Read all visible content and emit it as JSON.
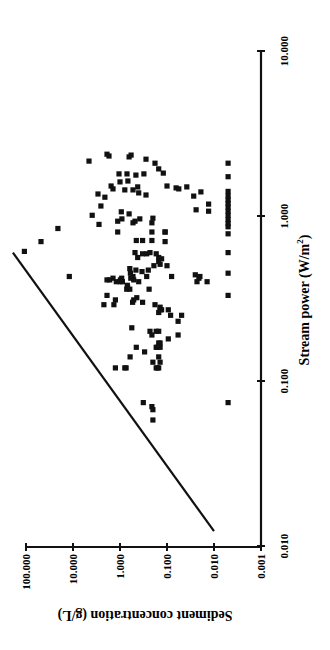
{
  "chart_data": {
    "type": "scatter",
    "orientation": "figure rotated 90 degrees counter-clockwise",
    "title": "",
    "xlabel": "Stream power (W/m²)",
    "xlabel_base": "Stream power (W/m",
    "xlabel_sup": "2",
    "xlabel_tail": ")",
    "ylabel": "Sediment concentration (g/L)",
    "xscale": "log",
    "yscale": "log",
    "xlim": [
      0.01,
      10
    ],
    "ylim": [
      0.001,
      100
    ],
    "x_ticks": [
      "0.010",
      "0.100",
      "1.000",
      "10.000"
    ],
    "y_ticks": [
      "0.001",
      "0.010",
      "0.100",
      "1.000",
      "10.000",
      "100.000"
    ],
    "grid": false,
    "legend": null,
    "marker": "filled square",
    "marker_color": "#111111",
    "line": {
      "name": "threshold line",
      "points": [
        [
          0.0123,
          0.01
        ],
        [
          0.6,
          190
        ]
      ]
    },
    "series": [
      {
        "name": "observations",
        "points": [
          [
            2.15,
            4.57
          ],
          [
            2.37,
            1.89
          ],
          [
            2.31,
            1.71
          ],
          [
            2.28,
            0.64
          ],
          [
            2.34,
            0.58
          ],
          [
            2.21,
            0.28
          ],
          [
            2.09,
            0.18
          ],
          [
            1.93,
            0.15
          ],
          [
            1.82,
            0.12
          ],
          [
            1.8,
            1.05
          ],
          [
            1.8,
            0.71
          ],
          [
            1.77,
            0.46
          ],
          [
            1.8,
            0.31
          ],
          [
            1.61,
            1.0
          ],
          [
            1.63,
            0.68
          ],
          [
            1.52,
            1.55
          ],
          [
            1.46,
            1.41
          ],
          [
            1.44,
            0.79
          ],
          [
            1.44,
            0.53
          ],
          [
            1.5,
            0.42
          ],
          [
            1.38,
            0.4
          ],
          [
            1.34,
            0.28
          ],
          [
            1.52,
            0.1
          ],
          [
            1.48,
            0.064
          ],
          [
            1.46,
            0.056
          ],
          [
            1.5,
            0.038
          ],
          [
            1.32,
            0.027
          ],
          [
            1.4,
            0.019
          ],
          [
            1.36,
            2.94
          ],
          [
            1.3,
            2.1
          ],
          [
            1.15,
            2.55
          ],
          [
            1.09,
            0.024
          ],
          [
            1.18,
            0.013
          ],
          [
            1.07,
            0.013
          ],
          [
            1.01,
            3.9
          ],
          [
            0.89,
            2.8
          ],
          [
            1.06,
            0.94
          ],
          [
            0.96,
            0.91
          ],
          [
            1.03,
            0.64
          ],
          [
            0.91,
            0.53
          ],
          [
            0.96,
            0.38
          ],
          [
            0.97,
            0.2
          ],
          [
            0.91,
            0.21
          ],
          [
            0.84,
            21
          ],
          [
            0.7,
            48
          ],
          [
            0.61,
            108
          ],
          [
            0.93,
            1.12
          ],
          [
            0.8,
            1.12
          ],
          [
            0.93,
            0.48
          ],
          [
            0.71,
            0.45
          ],
          [
            0.71,
            0.33
          ],
          [
            0.8,
            0.21
          ],
          [
            0.71,
            0.21
          ],
          [
            0.8,
            0.11
          ],
          [
            0.8,
            0.11
          ],
          [
            0.7,
            0.11
          ],
          [
            0.6,
            0.48
          ],
          [
            0.56,
            0.42
          ],
          [
            0.59,
            0.33
          ],
          [
            0.59,
            0.27
          ],
          [
            0.6,
            0.23
          ],
          [
            0.56,
            0.15
          ],
          [
            0.53,
            0.15
          ],
          [
            0.55,
            0.13
          ],
          [
            0.59,
            0.17
          ],
          [
            0.5,
            0.19
          ],
          [
            0.47,
            0.25
          ],
          [
            0.43,
            0.27
          ],
          [
            0.46,
            0.34
          ],
          [
            0.48,
            0.62
          ],
          [
            0.47,
            0.46
          ],
          [
            0.45,
            0.6
          ],
          [
            0.43,
            0.53
          ],
          [
            0.42,
            0.92
          ],
          [
            0.4,
            0.99
          ],
          [
            0.36,
            0.72
          ],
          [
            0.41,
            0.51
          ],
          [
            0.37,
            0.69
          ],
          [
            0.38,
            0.7
          ],
          [
            0.41,
            0.98
          ],
          [
            0.36,
            0.62
          ],
          [
            0.43,
            12
          ],
          [
            0.43,
            0.08
          ],
          [
            0.5,
            0.1
          ],
          [
            0.51,
            0.14
          ],
          [
            0.43,
            0.02
          ],
          [
            0.44,
            0.025
          ],
          [
            0.42,
            0.021
          ],
          [
            0.4,
            0.014
          ],
          [
            0.41,
            1.89
          ],
          [
            0.41,
            1.66
          ],
          [
            0.42,
            1.41
          ],
          [
            0.4,
            1.2
          ],
          [
            0.4,
            0.89
          ],
          [
            0.42,
            0.59
          ],
          [
            0.4,
            0.4
          ],
          [
            0.36,
            0.24
          ],
          [
            0.4,
            0.023
          ],
          [
            0.33,
            1.89
          ],
          [
            0.31,
            1.25
          ],
          [
            0.29,
            2.2
          ],
          [
            0.29,
            1.35
          ],
          [
            0.31,
            0.51
          ],
          [
            0.32,
            0.44
          ],
          [
            0.3,
            0.54
          ],
          [
            0.3,
            0.33
          ],
          [
            0.29,
            0.18
          ],
          [
            0.28,
            0.14
          ],
          [
            0.27,
            0.14
          ],
          [
            0.26,
            0.15
          ],
          [
            0.27,
            0.13
          ],
          [
            0.27,
            0.094
          ],
          [
            0.25,
            0.084
          ],
          [
            0.23,
            0.058
          ],
          [
            0.25,
            0.049
          ],
          [
            0.21,
            0.56
          ],
          [
            0.2,
            0.23
          ],
          [
            0.2,
            0.17
          ],
          [
            0.2,
            0.15
          ],
          [
            0.19,
            0.21
          ],
          [
            0.18,
            0.094
          ],
          [
            0.19,
            0.058
          ],
          [
            0.17,
            0.14
          ],
          [
            0.17,
            0.15
          ],
          [
            0.16,
            0.14
          ],
          [
            0.16,
            0.17
          ],
          [
            0.16,
            0.16
          ],
          [
            0.15,
            0.3
          ],
          [
            0.16,
            0.45
          ],
          [
            0.14,
            0.61
          ],
          [
            0.13,
            0.2
          ],
          [
            0.14,
            0.15
          ],
          [
            0.13,
            0.14
          ],
          [
            0.12,
            0.17
          ],
          [
            0.12,
            0.15
          ],
          [
            0.12,
            0.16
          ],
          [
            0.12,
            1.25
          ],
          [
            0.12,
            0.74
          ],
          [
            0.12,
            0.79
          ],
          [
            0.074,
            0.32
          ],
          [
            0.07,
            0.21
          ],
          [
            0.067,
            0.2
          ],
          [
            0.058,
            0.2
          ],
          [
            0.074,
            0.005
          ],
          [
            2.09,
            0.005
          ],
          [
            1.73,
            0.005
          ],
          [
            1.41,
            0.005
          ],
          [
            1.32,
            0.005
          ],
          [
            1.25,
            0.005
          ],
          [
            1.19,
            0.005
          ],
          [
            1.13,
            0.005
          ],
          [
            1.07,
            0.005
          ],
          [
            1.01,
            0.005
          ],
          [
            0.95,
            0.005
          ],
          [
            0.9,
            0.005
          ],
          [
            0.86,
            0.005
          ],
          [
            0.78,
            0.005
          ],
          [
            0.6,
            0.005
          ],
          [
            0.45,
            0.005
          ],
          [
            0.33,
            0.005
          ]
        ]
      }
    ]
  }
}
